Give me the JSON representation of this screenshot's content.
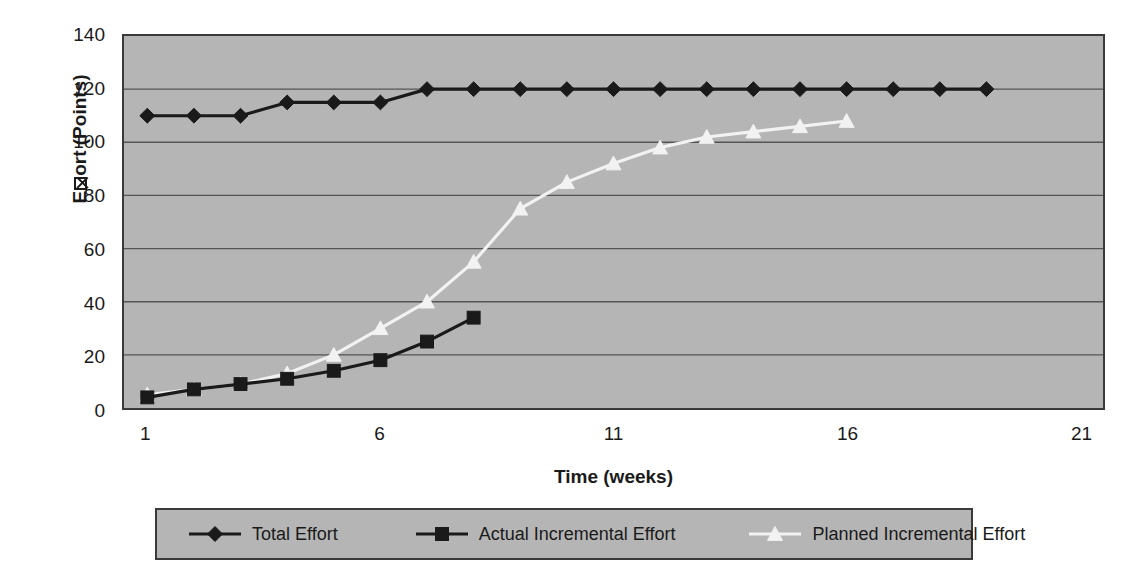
{
  "chart_data": {
    "type": "line",
    "title": "",
    "xlabel": "Time (weeks)",
    "ylabel": "E☒ort (Points)",
    "ylabel_plain": "Effort (Points)",
    "ylabel_prefix": "E",
    "ylabel_suffix": "ort (Points)",
    "ylim": [
      0,
      140
    ],
    "y_ticks": [
      0,
      20,
      40,
      60,
      80,
      100,
      120,
      140
    ],
    "y_tick_labels": [
      "0",
      "20",
      "40",
      "60",
      "80",
      "100",
      "120",
      "140"
    ],
    "xlim": [
      1,
      21
    ],
    "x_ticks": [
      1,
      6,
      11,
      16,
      21
    ],
    "x_tick_labels": [
      "1",
      "6",
      "11",
      "16",
      "21"
    ],
    "x_minor_tick_interval": 1,
    "grid": "horizontal",
    "legend_position": "bottom",
    "plot_background": "#b5b5b5",
    "gridline_color": "#555555",
    "axis_color": "#3a3a3a",
    "x": [
      1,
      2,
      3,
      4,
      5,
      6,
      7,
      8,
      9,
      10,
      11,
      12,
      13,
      14,
      15,
      16,
      17,
      18,
      19
    ],
    "series": [
      {
        "name": "Total Effort",
        "marker": "diamond",
        "color": "#1a1a1a",
        "line_color": "#1a1a1a",
        "x": [
          1,
          2,
          3,
          4,
          5,
          6,
          7,
          8,
          9,
          10,
          11,
          12,
          13,
          14,
          15,
          16,
          17,
          18,
          19
        ],
        "values": [
          110,
          110,
          110,
          115,
          115,
          115,
          120,
          120,
          120,
          120,
          120,
          120,
          120,
          120,
          120,
          120,
          120,
          120,
          120
        ]
      },
      {
        "name": "Actual Incremental Effort",
        "marker": "square",
        "color": "#1a1a1a",
        "line_color": "#1a1a1a",
        "x": [
          1,
          2,
          3,
          4,
          5,
          6,
          7,
          8
        ],
        "values": [
          4,
          7,
          9,
          11,
          14,
          18,
          25,
          34
        ]
      },
      {
        "name": "Planned Incremental Effort",
        "marker": "triangle",
        "color": "#f2f2f2",
        "line_color": "#f2f2f2",
        "x": [
          1,
          2,
          3,
          4,
          5,
          6,
          7,
          8,
          9,
          10,
          11,
          12,
          13,
          14,
          15,
          16
        ],
        "values": [
          5,
          7,
          9,
          13,
          20,
          30,
          40,
          55,
          75,
          85,
          92,
          98,
          102,
          104,
          106,
          108
        ]
      }
    ]
  },
  "legend": {
    "items": [
      {
        "label": "Total Effort",
        "marker": "diamond",
        "color": "#1a1a1a"
      },
      {
        "label": "Actual Incremental Effort",
        "marker": "square",
        "color": "#1a1a1a"
      },
      {
        "label": "Planned Incremental Effort",
        "marker": "triangle",
        "color": "#f2f2f2"
      }
    ]
  }
}
